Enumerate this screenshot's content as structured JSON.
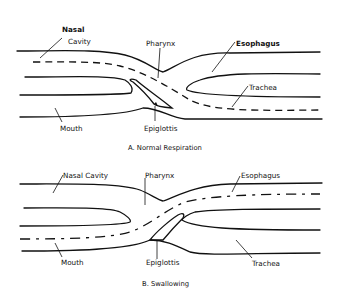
{
  "figure": {
    "panels": [
      {
        "id": "A",
        "caption": "A. Normal Respiration",
        "labels": {
          "nasal_cavity_line1": "Nasal",
          "nasal_cavity_line2": "Cavity",
          "pharynx": "Pharynx",
          "esophagus": "Esophagus",
          "trachea": "Trachea",
          "mouth": "Mouth",
          "epiglottis": "Epiglottis"
        },
        "airflow": "dashed line from nasal cavity through pharynx into trachea"
      },
      {
        "id": "B",
        "caption": "B. Swallowing",
        "labels": {
          "nasal_cavity": "Nasal Cavity",
          "pharynx": "Pharynx",
          "esophagus": "Esophagus",
          "trachea": "Trachea",
          "mouth": "Mouth",
          "epiglottis": "Epiglottis"
        },
        "foodflow": "dash-dot line from mouth through pharynx into esophagus"
      }
    ]
  }
}
